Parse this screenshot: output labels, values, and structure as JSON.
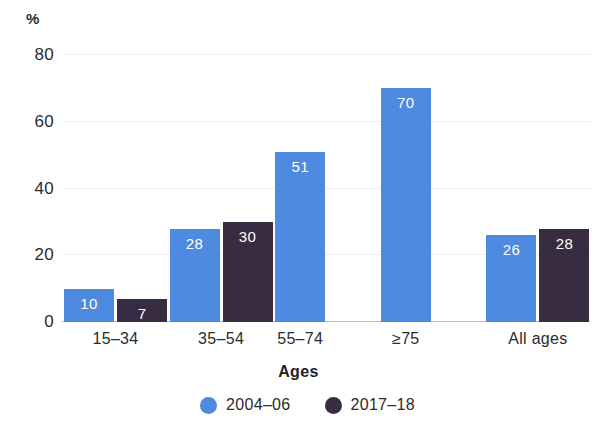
{
  "chart_data": {
    "type": "bar",
    "title": "",
    "subtitle": "",
    "xlabel": "Ages",
    "ylabel": "%",
    "categories": [
      "15–34",
      "35–54",
      "55–74",
      "≥75",
      "All ages"
    ],
    "series": [
      {
        "name": "2004–06",
        "color": "#4d8ae0",
        "values": [
          10,
          28,
          51,
          70,
          26
        ],
        "labels": [
          "10",
          "28",
          "51",
          "70",
          "26"
        ]
      },
      {
        "name": "2017–18",
        "color": "#382c42",
        "values": [
          7,
          30,
          null,
          null,
          28
        ],
        "labels": [
          "7",
          "30",
          null,
          null,
          "28"
        ]
      }
    ],
    "ylim": [
      0,
      80
    ],
    "yticks": [
      0,
      20,
      40,
      60,
      80
    ],
    "ytick_labels": [
      "0",
      "20",
      "40",
      "60",
      "80"
    ],
    "grid": true,
    "grid_color": "#eceef1",
    "axis_color": "#b9bcc2",
    "legend_position": "bottom",
    "data_label_color": "#ffffff",
    "background": "#ffffff"
  },
  "axis": {
    "unit_label": "%",
    "x_title": "Ages"
  }
}
